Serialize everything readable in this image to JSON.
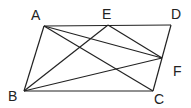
{
  "diagram": {
    "type": "geometry",
    "points": {
      "A": {
        "x": 44,
        "y": 26,
        "label": "A",
        "lx": 31,
        "ly": 20
      },
      "E": {
        "x": 108,
        "y": 25,
        "label": "E",
        "lx": 102,
        "ly": 19
      },
      "D": {
        "x": 171,
        "y": 25,
        "label": "D",
        "lx": 171,
        "ly": 19
      },
      "F": {
        "x": 162,
        "y": 58,
        "label": "F",
        "lx": 173,
        "ly": 76
      },
      "B": {
        "x": 24,
        "y": 91,
        "label": "B",
        "lx": 8,
        "ly": 101
      },
      "C": {
        "x": 153,
        "y": 91,
        "label": "C",
        "lx": 154,
        "ly": 104
      }
    },
    "segments": [
      [
        "A",
        "D"
      ],
      [
        "D",
        "C"
      ],
      [
        "C",
        "B"
      ],
      [
        "B",
        "A"
      ],
      [
        "A",
        "C"
      ],
      [
        "A",
        "F"
      ],
      [
        "E",
        "F"
      ],
      [
        "E",
        "B"
      ],
      [
        "B",
        "F"
      ]
    ],
    "line_color": "#222222"
  }
}
